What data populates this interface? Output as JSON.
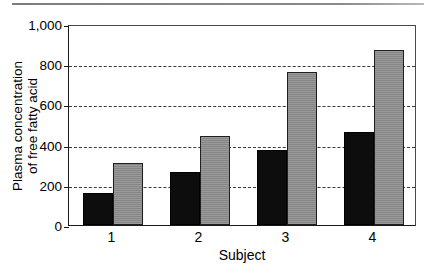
{
  "chart_data": {
    "type": "bar",
    "title": "",
    "subtitle": "",
    "xlabel": "Subject",
    "ylabel": "Plasma concentration of free fatty acid",
    "ylabel_lines": [
      "Plasma concentration",
      "of free fatty acid"
    ],
    "categories": [
      "1",
      "2",
      "3",
      "4"
    ],
    "series": [
      {
        "name": "series-a",
        "color": "#0d0d0d",
        "values": [
          160,
          265,
          375,
          465
        ]
      },
      {
        "name": "series-b",
        "color": "#8e8e8e",
        "values": [
          310,
          445,
          760,
          870
        ]
      }
    ],
    "ylim": [
      0,
      1000
    ],
    "ytick_values": [
      0,
      200,
      400,
      600,
      800,
      1000
    ],
    "ytick_labels": [
      "0",
      "200",
      "400",
      "600",
      "800",
      "1,000"
    ],
    "grid": true,
    "grid_axis": "y",
    "grid_style": "dashed",
    "legend": "none",
    "legend_position": "none"
  },
  "figure": {
    "top_rule_color": "#7d7d7d",
    "axis_color": "#1a1a1a",
    "background": "#ffffff"
  }
}
